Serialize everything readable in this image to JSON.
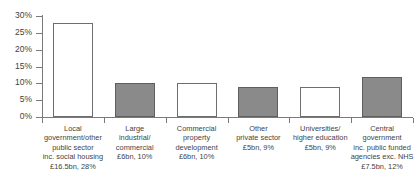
{
  "chart_data": {
    "type": "bar",
    "title": "",
    "subtitle": "",
    "xlabel": "",
    "ylabel": "",
    "ylim": [
      0,
      30
    ],
    "ytick_labels": [
      "0%",
      "5%",
      "10%",
      "15%",
      "20%",
      "25%",
      "30%"
    ],
    "ytick_values": [
      0,
      5,
      10,
      15,
      20,
      25,
      30
    ],
    "grid": false,
    "legend": "none",
    "categories": [
      "Local government/other public sector inc. social housing £16.5bn, 28%",
      "Large industrial/commercial £6bn, 10%",
      "Commercial property development £6bn, 10%",
      "Other private sector £5bn, 9%",
      "Universities/higher education £5bn, 9%",
      "Central government inc. public funded agencies exc. NHS £7.5bn, 12%"
    ],
    "values": [
      28,
      10,
      10,
      9,
      9,
      12
    ],
    "bar_styles": [
      "open",
      "solid",
      "open",
      "solid",
      "open",
      "solid"
    ],
    "bars": [
      {
        "label_lines": [
          "Local",
          "government/other",
          "public sector",
          "inc. social housing",
          "£16.5bn, 28%"
        ],
        "name": "Local government/other public sector inc. social housing",
        "amount": "£16.5bn",
        "percent": "28%",
        "value": 28,
        "style": "open"
      },
      {
        "label_lines": [
          "Large",
          "industrial/",
          "commercial",
          "£6bn, 10%"
        ],
        "name": "Large industrial/commercial",
        "amount": "£6bn",
        "percent": "10%",
        "value": 10,
        "style": "solid"
      },
      {
        "label_lines": [
          "Commercial",
          "property",
          "development",
          "£6bn, 10%"
        ],
        "name": "Commercial property development",
        "amount": "£6bn",
        "percent": "10%",
        "value": 10,
        "style": "open"
      },
      {
        "label_lines": [
          "Other",
          "private sector",
          "£5bn, 9%"
        ],
        "name": "Other private sector",
        "amount": "£5bn",
        "percent": "9%",
        "value": 9,
        "style": "solid"
      },
      {
        "label_lines": [
          "Universities/",
          "higher education",
          "£5bn, 9%"
        ],
        "name": "Universities/higher education",
        "amount": "£5bn",
        "percent": "9%",
        "value": 9,
        "style": "open"
      },
      {
        "label_lines": [
          "Central",
          "government",
          "inc. public funded",
          "agencies exc. NHS",
          "£7.5bn, 12%"
        ],
        "name": "Central government inc. public funded agencies exc. NHS",
        "amount": "£7.5bn",
        "percent": "12%",
        "value": 12,
        "style": "solid"
      }
    ],
    "colors": {
      "bar_open_fill": "#ffffff",
      "bar_solid_fill": "#8a8a8a",
      "bar_border": "#6e6e6e",
      "axis": "#7a7a7a",
      "text": "#3f3f3f",
      "background": "#ffffff"
    }
  }
}
